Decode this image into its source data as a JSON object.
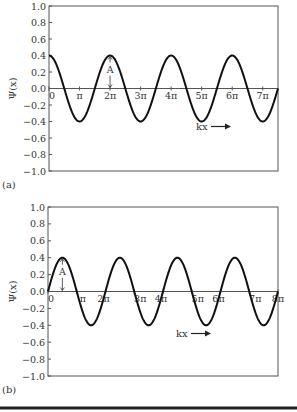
{
  "chart_data": [
    {
      "panel_label": "(a)",
      "type": "line",
      "function": "0.4*cos(kx)",
      "amplitude": 0.4,
      "ylabel": "Ψ(x)",
      "xlabel": "kx",
      "xlabel_arrow": "→",
      "ylim": [
        -1.0,
        1.0
      ],
      "xlim_pi": [
        0,
        7.5
      ],
      "yticks": [
        "1.0",
        "0.8",
        "0.6",
        "0.4",
        "0.2",
        "0.0",
        "-0.2",
        "-0.4",
        "-0.6",
        "-0.8",
        "-1.0"
      ],
      "xticks": [
        {
          "label": "0",
          "pos_pi": 0
        },
        {
          "label": "π",
          "pos_pi": 1
        },
        {
          "label": "2π",
          "pos_pi": 2
        },
        {
          "label": "3π",
          "pos_pi": 3
        },
        {
          "label": "4π",
          "pos_pi": 4
        },
        {
          "label": "5π",
          "pos_pi": 5
        },
        {
          "label": "6π",
          "pos_pi": 6
        },
        {
          "label": "7π",
          "pos_pi": 7
        }
      ],
      "annotation": "A",
      "annotation_at_pi": 2,
      "grid": false
    },
    {
      "panel_label": "(b)",
      "type": "line",
      "function": "0.4*sin(kx)",
      "amplitude": 0.4,
      "ylabel": "Ψ(x)",
      "xlabel": "kx",
      "xlabel_arrow": "→",
      "ylim": [
        -1.0,
        1.0
      ],
      "xlim_pi": [
        0,
        8
      ],
      "yticks": [
        "1.0",
        "0.8",
        "0.6",
        "0.4",
        "0.2",
        "0.0",
        "-0.2",
        "-0.4",
        "-0.6",
        "-0.8",
        "-1.0"
      ],
      "xticks": [
        {
          "label": "0",
          "pos_pi": 0
        },
        {
          "label": "π",
          "pos_pi": 1
        },
        {
          "label": "2π",
          "pos_pi": 2
        },
        {
          "label": "3π",
          "pos_pi": 3
        },
        {
          "label": "4π",
          "pos_pi": 4
        },
        {
          "label": "5π",
          "pos_pi": 5
        },
        {
          "label": "6π",
          "pos_pi": 6
        },
        {
          "label": "7π",
          "pos_pi": 7
        },
        {
          "label": "8π",
          "pos_pi": 8
        }
      ],
      "annotation": "A",
      "annotation_at_pi": 0.5,
      "grid": false
    }
  ]
}
